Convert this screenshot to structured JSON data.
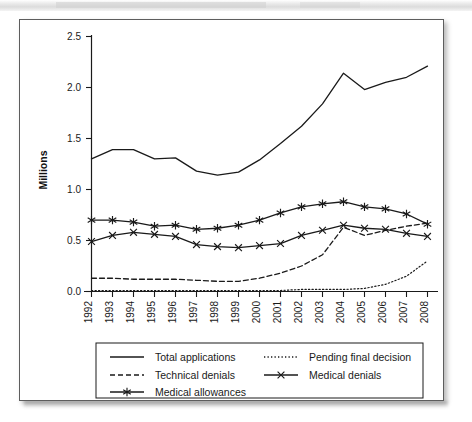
{
  "figure": {
    "background_color": "#ffffff",
    "page_border_color": "#5d5d5d",
    "line_color": "#1a1a1a"
  },
  "chart_data": {
    "type": "line",
    "title": "",
    "xlabel": "",
    "ylabel": "Millions",
    "xlim": [
      1992,
      2008
    ],
    "ylim": [
      0.0,
      2.5
    ],
    "ytick_labels": [
      "0.0",
      "0.5",
      "1.0",
      "1.5",
      "2.0",
      "2.5"
    ],
    "ytick_values": [
      0.0,
      0.5,
      1.0,
      1.5,
      2.0,
      2.5
    ],
    "grid": false,
    "legend_position": "bottom",
    "categories": [
      1992,
      1993,
      1994,
      1995,
      1996,
      1997,
      1998,
      1999,
      2000,
      2001,
      2002,
      2003,
      2004,
      2005,
      2006,
      2007,
      2008
    ],
    "xtick_labels": [
      "1992",
      "1993",
      "1994",
      "1995",
      "1996",
      "1997",
      "1998",
      "1999",
      "2000",
      "2001",
      "2002",
      "2003",
      "2004",
      "2005",
      "2006",
      "2007",
      "2008"
    ],
    "series": [
      {
        "name": "Total applications",
        "style": "solid",
        "marker": "none",
        "values": [
          1.3,
          1.39,
          1.39,
          1.3,
          1.31,
          1.18,
          1.14,
          1.17,
          1.29,
          1.45,
          1.62,
          1.84,
          2.14,
          1.98,
          2.05,
          2.1,
          2.21
        ]
      },
      {
        "name": "Pending final decision",
        "style": "dotted",
        "marker": "none",
        "values": [
          0.01,
          0.01,
          0.01,
          0.01,
          0.01,
          0.01,
          0.01,
          0.01,
          0.01,
          0.01,
          0.02,
          0.02,
          0.02,
          0.03,
          0.07,
          0.15,
          0.3
        ]
      },
      {
        "name": "Technical denials",
        "style": "dashed",
        "marker": "none",
        "values": [
          0.13,
          0.13,
          0.12,
          0.12,
          0.12,
          0.11,
          0.1,
          0.1,
          0.13,
          0.18,
          0.25,
          0.36,
          0.63,
          0.55,
          0.6,
          0.64,
          0.67
        ]
      },
      {
        "name": "Medical denials",
        "style": "solid",
        "marker": "x",
        "values": [
          0.49,
          0.55,
          0.58,
          0.56,
          0.54,
          0.46,
          0.44,
          0.43,
          0.45,
          0.47,
          0.55,
          0.6,
          0.65,
          0.62,
          0.61,
          0.57,
          0.54
        ]
      },
      {
        "name": "Medical allowances",
        "style": "solid",
        "marker": "asterisk",
        "values": [
          0.7,
          0.7,
          0.68,
          0.64,
          0.65,
          0.61,
          0.62,
          0.65,
          0.7,
          0.77,
          0.83,
          0.86,
          0.88,
          0.83,
          0.81,
          0.76,
          0.66
        ]
      }
    ]
  },
  "legend": {
    "entries": [
      {
        "label": "Total applications",
        "style": "solid",
        "marker": "none"
      },
      {
        "label": "Pending final decision",
        "style": "dotted",
        "marker": "none"
      },
      {
        "label": "Technical denials",
        "style": "dashed",
        "marker": "none"
      },
      {
        "label": "Medical denials",
        "style": "solid",
        "marker": "x"
      },
      {
        "label": "Medical allowances",
        "style": "solid",
        "marker": "asterisk"
      }
    ]
  }
}
